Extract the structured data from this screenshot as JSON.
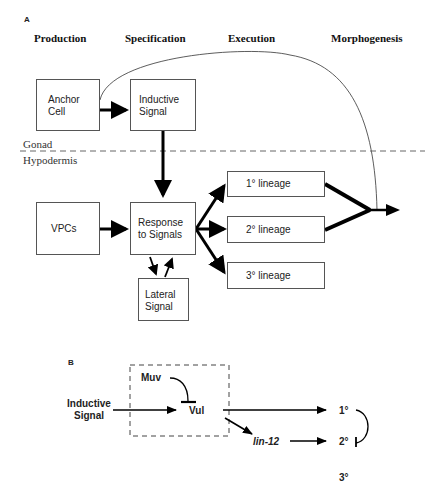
{
  "panel_a": {
    "label": "A",
    "stages": [
      "Production",
      "Specification",
      "Execution",
      "Morphogenesis"
    ],
    "boxes": {
      "anchor_cell": [
        "Anchor",
        "Cell"
      ],
      "inductive_signal": [
        "Inductive",
        "Signal"
      ],
      "vpcs": [
        "VPCs"
      ],
      "response": [
        "Response",
        "to Signals"
      ],
      "lateral_signal": [
        "Lateral",
        "Signal"
      ],
      "lineage_1": "1° lineage",
      "lineage_2": "2° lineage",
      "lineage_3": "3° lineage"
    },
    "tissue_labels": {
      "top": "Gonad",
      "bottom": "Hypodermis"
    }
  },
  "panel_b": {
    "label": "B",
    "inductive_signal": [
      "Inductive",
      "Signal"
    ],
    "muv": "Muv",
    "vul": "Vul",
    "lin12": "lin-12",
    "fates": [
      "1°",
      "2°",
      "3°"
    ]
  }
}
